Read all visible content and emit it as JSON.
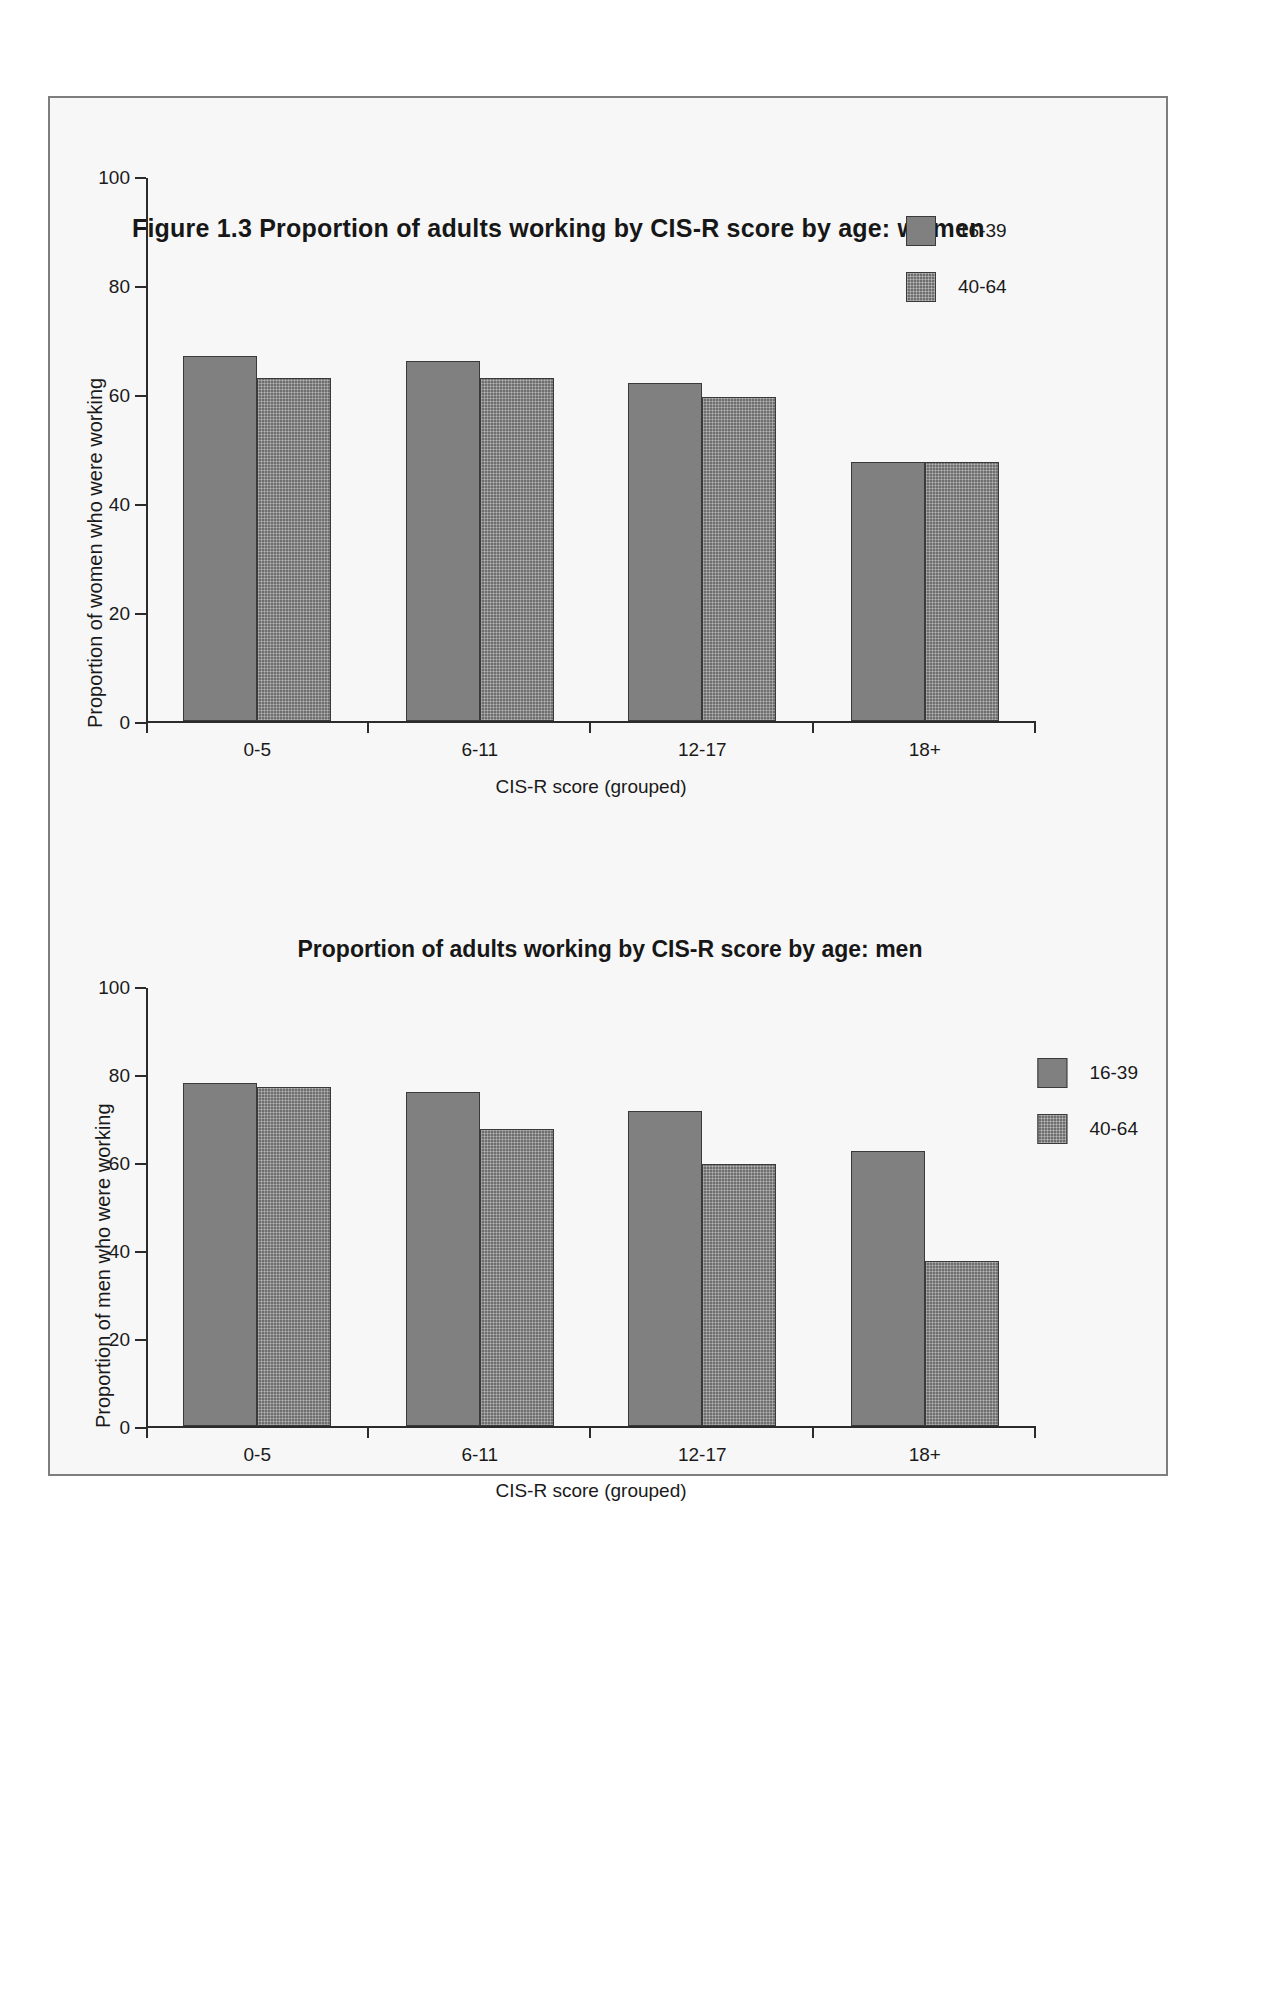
{
  "figure": {
    "label": "Figure 1.3",
    "title": "Figure 1.3  Proportion of adults working by CIS-R score by age: women"
  },
  "chart_data": [
    {
      "type": "bar",
      "title": "Figure 1.3  Proportion of adults working by CIS-R score by age: women",
      "xlabel": "CIS-R score (grouped)",
      "ylabel": "Proportion of women who were working",
      "categories": [
        "0-5",
        "6-11",
        "12-17",
        "18+"
      ],
      "series": [
        {
          "name": "16-39",
          "values": [
            67,
            66,
            62,
            47.5
          ],
          "color": "#808080"
        },
        {
          "name": "40-64",
          "values": [
            63,
            63,
            59.5,
            47.5
          ],
          "color": "#6e6e6e"
        }
      ],
      "yticks": [
        0,
        20,
        40,
        60,
        80,
        100
      ],
      "ylim": [
        0,
        100
      ],
      "grid": false,
      "legend_position": "top-right"
    },
    {
      "type": "bar",
      "title": "Proportion of adults working by CIS-R score by age: men",
      "xlabel": "CIS-R score (grouped)",
      "ylabel": "Proportion of men who were working",
      "categories": [
        "0-5",
        "6-11",
        "12-17",
        "18+"
      ],
      "series": [
        {
          "name": "16-39",
          "values": [
            78,
            76,
            71.5,
            62.5
          ],
          "color": "#808080"
        },
        {
          "name": "40-64",
          "values": [
            77,
            67.5,
            59.5,
            37.5
          ],
          "color": "#6e6e6e"
        }
      ],
      "yticks": [
        0,
        20,
        40,
        60,
        80,
        100
      ],
      "ylim": [
        0,
        100
      ],
      "grid": false,
      "legend_position": "top-right"
    }
  ]
}
